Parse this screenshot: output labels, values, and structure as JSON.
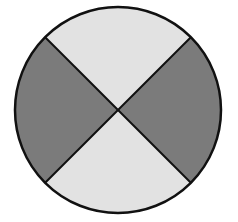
{
  "diagram": {
    "type": "divided-circle",
    "center": {
      "x": 118,
      "y": 110
    },
    "radius": 103,
    "outline_color": "#111111",
    "outline_width": 2.5,
    "divider_color": "#111111",
    "divider_width": 2,
    "sectors": [
      {
        "name": "top",
        "shade": "light",
        "color": "#e2e2e2",
        "start_deg": 225,
        "end_deg": 315
      },
      {
        "name": "right",
        "shade": "dark",
        "color": "#7b7b7b",
        "start_deg": 315,
        "end_deg": 405
      },
      {
        "name": "bottom",
        "shade": "light",
        "color": "#e2e2e2",
        "start_deg": 45,
        "end_deg": 135
      },
      {
        "name": "left",
        "shade": "dark",
        "color": "#7b7b7b",
        "start_deg": 135,
        "end_deg": 225
      }
    ]
  }
}
